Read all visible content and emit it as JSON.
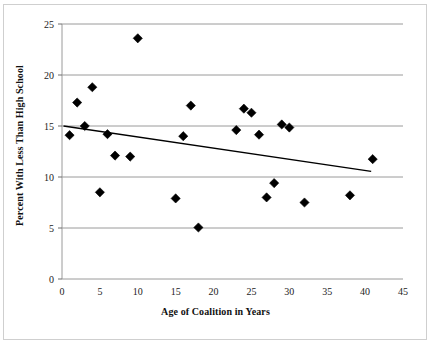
{
  "chart_data": {
    "type": "scatter",
    "title": "",
    "xlabel": "Age of Coalition in Years",
    "ylabel": "Percent With Less Than High School",
    "xlim": [
      0,
      45
    ],
    "ylim": [
      0,
      25
    ],
    "xticks": [
      0,
      5,
      10,
      15,
      20,
      25,
      30,
      35,
      40,
      45
    ],
    "yticks": [
      0,
      5,
      10,
      15,
      20,
      25
    ],
    "grid": "horizontal",
    "legend": "none",
    "marker": "filled-diamond",
    "marker_color": "#000000",
    "points": [
      {
        "x": 1,
        "y": 14.1
      },
      {
        "x": 2,
        "y": 17.3
      },
      {
        "x": 3,
        "y": 15.0
      },
      {
        "x": 4,
        "y": 18.8
      },
      {
        "x": 5,
        "y": 8.5
      },
      {
        "x": 6,
        "y": 14.2
      },
      {
        "x": 7,
        "y": 12.1
      },
      {
        "x": 9,
        "y": 12.0
      },
      {
        "x": 10,
        "y": 23.6
      },
      {
        "x": 15,
        "y": 7.9
      },
      {
        "x": 16,
        "y": 14.0
      },
      {
        "x": 17,
        "y": 17.0
      },
      {
        "x": 18,
        "y": 5.05
      },
      {
        "x": 23,
        "y": 14.6
      },
      {
        "x": 24,
        "y": 16.7
      },
      {
        "x": 25,
        "y": 16.3
      },
      {
        "x": 26,
        "y": 14.15
      },
      {
        "x": 27,
        "y": 8.0
      },
      {
        "x": 28,
        "y": 9.4
      },
      {
        "x": 29,
        "y": 15.15
      },
      {
        "x": 30,
        "y": 14.85
      },
      {
        "x": 32,
        "y": 7.5
      },
      {
        "x": 38,
        "y": 8.2
      },
      {
        "x": 41,
        "y": 11.75
      }
    ],
    "trendline": {
      "type": "linear",
      "x_start": 0.2,
      "y_start": 15.0,
      "x_end": 40.8,
      "y_end": 10.55,
      "color": "#000000"
    }
  },
  "axes": {
    "x_tick_labels": [
      "0",
      "5",
      "10",
      "15",
      "20",
      "25",
      "30",
      "35",
      "40",
      "45"
    ],
    "y_tick_labels": [
      "0",
      "5",
      "10",
      "15",
      "20",
      "25"
    ]
  }
}
